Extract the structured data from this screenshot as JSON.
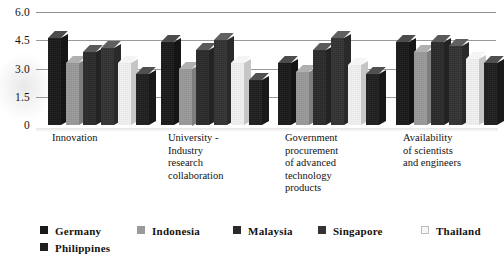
{
  "chart_data": {
    "type": "bar",
    "title": "",
    "subtitle": "",
    "xlabel": "",
    "ylabel": "",
    "ylim": [
      0,
      6.0
    ],
    "yticks": [
      "6.0",
      "4.5",
      "3.0",
      "1.5",
      "0"
    ],
    "ytick_values": [
      6.0,
      4.5,
      3.0,
      1.5,
      0
    ],
    "grid": true,
    "legend_position": "bottom",
    "style": "3d-bar",
    "categories": [
      "Innovation",
      "University -\nIndustry\nresearch\ncollaboration",
      "Government\nprocurement\nof advanced\ntechnology\nproducts",
      "Availability\nof scientists\nand engineers"
    ],
    "series": [
      {
        "name": "Germany",
        "color": "#1a1a1a",
        "values": [
          4.6,
          4.4,
          3.3,
          4.4
        ]
      },
      {
        "name": "Indonesia",
        "color": "#9a9a9a",
        "values": [
          3.3,
          3.0,
          2.8,
          3.9
        ]
      },
      {
        "name": "Malaysia",
        "color": "#2b2b2b",
        "values": [
          3.9,
          4.0,
          4.0,
          4.4
        ]
      },
      {
        "name": "Singapore",
        "color": "#333333",
        "values": [
          4.1,
          4.5,
          4.6,
          4.2
        ]
      },
      {
        "name": "Thailand",
        "color": "#f2f2f2",
        "values": [
          3.3,
          3.3,
          3.2,
          3.5
        ]
      },
      {
        "name": "Philippines",
        "color": "#1f1f1f",
        "values": [
          2.7,
          2.4,
          2.7,
          3.3
        ]
      }
    ]
  },
  "legend": {
    "row1": [
      {
        "label": "Germany",
        "color": "#1a1a1a"
      },
      {
        "label": "Indonesia",
        "color": "#9a9a9a"
      },
      {
        "label": "Malaysia",
        "color": "#2b2b2b"
      },
      {
        "label": "Singapore",
        "color": "#333333"
      },
      {
        "label": "Thailand",
        "color": "#f7f7f7"
      }
    ],
    "row2": [
      {
        "label": "Philippines",
        "color": "#1f1f1f"
      }
    ]
  }
}
